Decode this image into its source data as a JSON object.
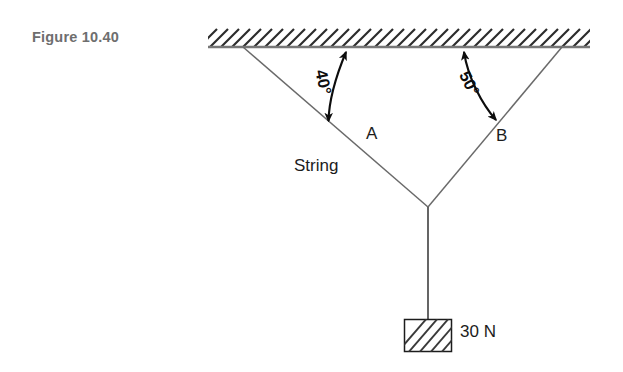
{
  "figure": {
    "label": "Figure 10.40",
    "label_color": "#6e6e6e"
  },
  "diagram": {
    "type": "free-body-string-tension",
    "ceiling": {
      "name": "hatched-ceiling",
      "x_start": 208,
      "x_end": 590,
      "y": 47,
      "hatch_direction": "up-right",
      "hatch_spacing": 11,
      "hatch_height": 18,
      "line_color": "#777777"
    },
    "strings": {
      "color": "#6a6a6a",
      "left": {
        "name": "string-A",
        "x1": 243,
        "y1": 47,
        "x2": 428,
        "y2": 207
      },
      "right": {
        "name": "string-B",
        "x1": 562,
        "y1": 47,
        "x2": 428,
        "y2": 207
      },
      "vertical": {
        "name": "string-vertical",
        "x1": 428,
        "y1": 207,
        "x2": 428,
        "y2": 320
      }
    },
    "junction": {
      "x": 428,
      "y": 207
    },
    "block": {
      "name": "hanging-block",
      "x": 404,
      "y": 319,
      "width": 48,
      "height": 33,
      "hatch_direction": "up-right",
      "border_color": "#1c1c1c"
    },
    "labels": {
      "string_a": "A",
      "string_b": "B",
      "string_generic": "String",
      "weight": "30 N"
    },
    "angles": {
      "left": {
        "name": "angle-40",
        "value": "40°",
        "degrees": 40,
        "measured_from": "ceiling",
        "arrow": "double-headed-arc"
      },
      "right": {
        "name": "angle-50",
        "value": "50°",
        "degrees": 50,
        "measured_from": "ceiling",
        "arrow": "double-headed-arc"
      }
    },
    "arc_color": "#0d0d0d"
  }
}
